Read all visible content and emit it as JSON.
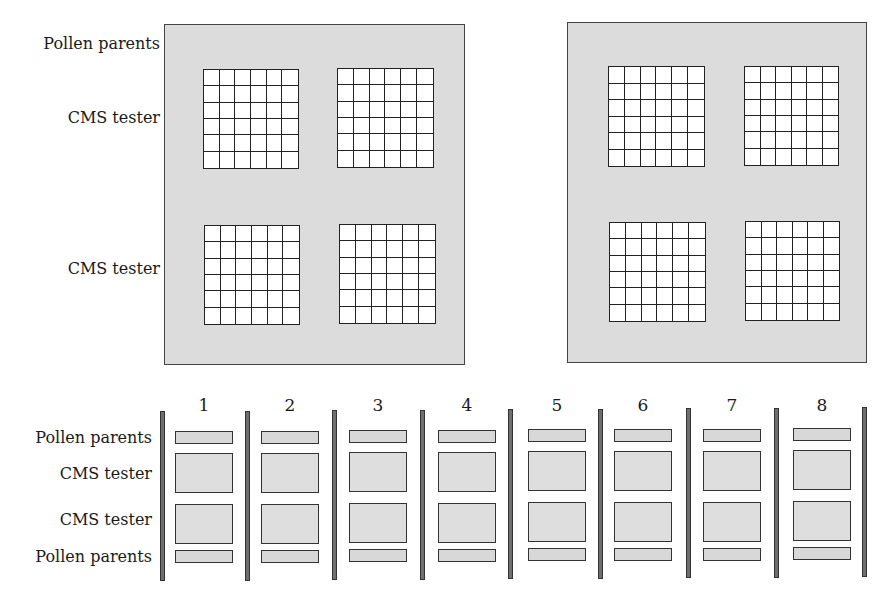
{
  "top_section": {
    "labels": {
      "pollen_parents": "Pollen parents",
      "cms_tester_1": "CMS tester",
      "cms_tester_2": "CMS tester"
    },
    "panels": [
      {
        "id": "left",
        "grids": 4,
        "grid_rows": 6,
        "grid_cols": 6
      },
      {
        "id": "right",
        "grids": 4,
        "grid_rows": 6,
        "grid_cols": 6
      }
    ]
  },
  "bottom_section": {
    "row_labels": [
      "Pollen parents",
      "CMS tester",
      "CMS tester",
      "Pollen parents"
    ],
    "plots": [
      {
        "number": "1"
      },
      {
        "number": "2"
      },
      {
        "number": "3"
      },
      {
        "number": "4"
      },
      {
        "number": "5"
      },
      {
        "number": "6"
      },
      {
        "number": "7"
      },
      {
        "number": "8"
      }
    ]
  },
  "colors": {
    "panel_fill": "#dcdcdc",
    "grid_fill": "#ffffff",
    "divider_fill": "#6f6f6f",
    "outline": "#333333"
  }
}
